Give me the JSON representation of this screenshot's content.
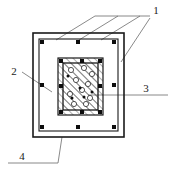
{
  "diagram": {
    "type": "engineering-cross-section",
    "canvas": {
      "width": 171,
      "height": 177,
      "background": "#ffffff"
    },
    "colors": {
      "line": "#1a1a1a",
      "leader_line": "#6b6b6b",
      "rebar_fill": "#0d0d0d",
      "hatch": "#4d4d4d",
      "core_fill": "#ffffff",
      "void_stroke": "#2b2b2b"
    },
    "callouts": [
      {
        "id": "callout-1",
        "label": "1",
        "text_x": 156,
        "text_y": 14,
        "leader": [
          [
            150,
            16
          ],
          [
            95,
            16
          ]
        ],
        "branches": [
          [
            [
              95,
              16
            ],
            [
              56,
              40
            ]
          ],
          [
            [
              118,
              16
            ],
            [
              79,
              40
            ]
          ],
          [
            [
              140,
              16
            ],
            [
              101,
              40
            ]
          ],
          [
            [
              150,
              18
            ],
            [
              121,
              62
            ]
          ]
        ]
      },
      {
        "id": "callout-2",
        "label": "2",
        "text_x": 14,
        "text_y": 75,
        "leader": [
          [
            22,
            72
          ],
          [
            52,
            92
          ]
        ],
        "branches": []
      },
      {
        "id": "callout-3",
        "label": "3",
        "text_x": 146,
        "text_y": 92,
        "leader": [
          [
            168,
            95
          ],
          [
            96,
            95
          ]
        ],
        "branches": [
          [
            [
              96,
              95
            ],
            [
              88,
              95
            ]
          ]
        ]
      },
      {
        "id": "callout-4",
        "label": "4",
        "text_x": 22,
        "text_y": 160,
        "leader": [
          [
            8,
            163
          ],
          [
            58,
            163
          ]
        ],
        "branches": [
          [
            [
              58,
              163
            ],
            [
              62,
              137
            ]
          ]
        ]
      }
    ],
    "outer_frame": {
      "x": 33,
      "y": 33,
      "width": 91,
      "height": 104
    },
    "outer_stirrup": {
      "x": 39,
      "y": 39,
      "width": 79,
      "height": 92
    },
    "inner_stirrup": {
      "x": 58,
      "y": 58,
      "width": 45,
      "height": 57
    },
    "core": {
      "x": 63,
      "y": 63,
      "width": 35,
      "height": 47
    },
    "outer_rebar": [
      {
        "x": 42,
        "y": 42
      },
      {
        "x": 78,
        "y": 42
      },
      {
        "x": 114,
        "y": 42
      },
      {
        "x": 42,
        "y": 85
      },
      {
        "x": 114,
        "y": 85
      },
      {
        "x": 42,
        "y": 127
      },
      {
        "x": 78,
        "y": 127
      },
      {
        "x": 114,
        "y": 127
      }
    ],
    "inner_rebar": [
      {
        "x": 61,
        "y": 61
      },
      {
        "x": 82,
        "y": 61
      },
      {
        "x": 100,
        "y": 61
      },
      {
        "x": 61,
        "y": 86
      },
      {
        "x": 100,
        "y": 86
      },
      {
        "x": 61,
        "y": 112
      },
      {
        "x": 82,
        "y": 112
      },
      {
        "x": 100,
        "y": 112
      }
    ],
    "core_voids": [
      {
        "x": 71,
        "y": 70,
        "r": 2.6
      },
      {
        "x": 84,
        "y": 68,
        "r": 2.6
      },
      {
        "x": 92,
        "y": 74,
        "r": 2.6
      },
      {
        "x": 76,
        "y": 80,
        "r": 2.6
      },
      {
        "x": 88,
        "y": 84,
        "r": 2.6
      },
      {
        "x": 70,
        "y": 94,
        "r": 2.6
      },
      {
        "x": 82,
        "y": 90,
        "r": 2.6
      },
      {
        "x": 90,
        "y": 98,
        "r": 2.6
      },
      {
        "x": 74,
        "y": 104,
        "r": 2.6
      },
      {
        "x": 86,
        "y": 104,
        "r": 2.6
      }
    ],
    "core_dots": [
      {
        "x": 68,
        "y": 76,
        "r": 1.5
      },
      {
        "x": 80,
        "y": 88,
        "r": 1.5
      },
      {
        "x": 92,
        "y": 92,
        "r": 1.5
      },
      {
        "x": 72,
        "y": 98,
        "r": 1.5
      },
      {
        "x": 84,
        "y": 97,
        "r": 1.5
      }
    ]
  }
}
